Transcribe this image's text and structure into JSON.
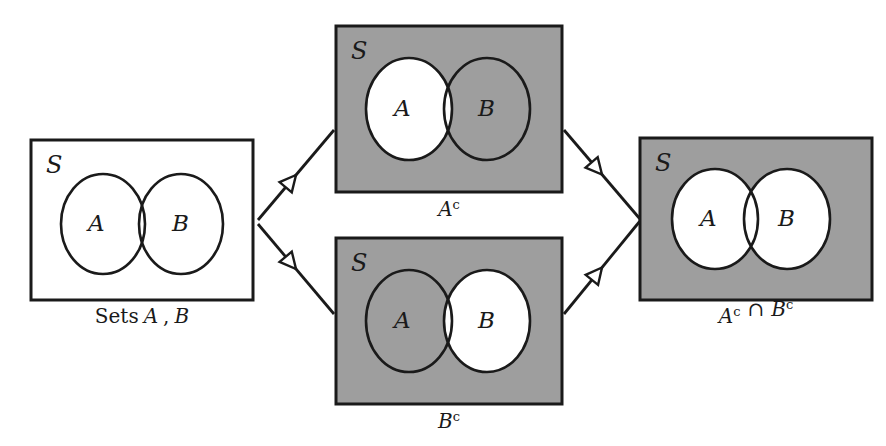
{
  "figure": {
    "type": "venn-diagram-flow",
    "background_color": "#ffffff",
    "shade_color": "#9e9e9e",
    "line_color": "#1a1a1a",
    "universe_symbol": "S",
    "set_a_symbol": "A",
    "set_b_symbol": "B"
  },
  "panels": [
    {
      "id": "sets-ab",
      "caption": "Sets A , B",
      "caption_parts": [
        {
          "text": "Sets",
          "style": "upright"
        },
        {
          "text": "A",
          "style": "italic"
        },
        {
          "text": ",",
          "style": "upright"
        },
        {
          "text": "B",
          "style": "italic"
        }
      ],
      "universe_label": "S",
      "box": {
        "x": 31,
        "y": 140,
        "w": 222,
        "h": 160
      },
      "box_fill": "white",
      "circle_a": {
        "cx": 103,
        "cy": 224,
        "rx": 42,
        "ry": 50,
        "fill": "white",
        "label": "A",
        "label_x": 88,
        "label_y": 231
      },
      "circle_b": {
        "cx": 181,
        "cy": 224,
        "rx": 42,
        "ry": 50,
        "fill": "white",
        "label": "B",
        "label_x": 172,
        "label_y": 231
      },
      "caption_x": 142,
      "caption_y": 323
    },
    {
      "id": "a-complement",
      "caption": "Ac",
      "caption_base": "A",
      "caption_sup": "c",
      "universe_label": "S",
      "box": {
        "x": 336,
        "y": 26,
        "w": 226,
        "h": 166
      },
      "box_fill": "shaded",
      "circle_a": {
        "cx": 409,
        "cy": 109,
        "rx": 43,
        "ry": 51,
        "fill": "white",
        "label": "A",
        "label_x": 394,
        "label_y": 116
      },
      "circle_b": {
        "cx": 487,
        "cy": 109,
        "rx": 43,
        "ry": 51,
        "fill": "shaded",
        "label": "B",
        "label_x": 478,
        "label_y": 116
      },
      "caption_x": 449,
      "caption_y": 216
    },
    {
      "id": "b-complement",
      "caption": "Bc",
      "caption_base": "B",
      "caption_sup": "c",
      "universe_label": "S",
      "box": {
        "x": 336,
        "y": 238,
        "w": 226,
        "h": 166
      },
      "box_fill": "shaded",
      "circle_a": {
        "cx": 409,
        "cy": 321,
        "rx": 43,
        "ry": 51,
        "fill": "shaded",
        "label": "A",
        "label_x": 394,
        "label_y": 328
      },
      "circle_b": {
        "cx": 487,
        "cy": 321,
        "rx": 43,
        "ry": 51,
        "fill": "white",
        "label": "B",
        "label_x": 478,
        "label_y": 328
      },
      "caption_x": 449,
      "caption_y": 428
    },
    {
      "id": "a-complement-intersect-b-complement",
      "caption": "Ac ∩ Bc",
      "caption_parts": [
        {
          "base": "A",
          "sup": "c"
        },
        {
          "op": "∩"
        },
        {
          "base": "B",
          "sup": "c"
        }
      ],
      "universe_label": "S",
      "box": {
        "x": 640,
        "y": 138,
        "w": 232,
        "h": 162
      },
      "box_fill": "shaded",
      "circle_a": {
        "cx": 715,
        "cy": 219,
        "rx": 43,
        "ry": 50,
        "fill": "white",
        "label": "A",
        "label_x": 700,
        "label_y": 226
      },
      "circle_b": {
        "cx": 787,
        "cy": 219,
        "rx": 43,
        "ry": 50,
        "fill": "white",
        "label": "B",
        "label_x": 778,
        "label_y": 226
      },
      "caption_x": 756,
      "caption_y": 323
    }
  ],
  "arrows": [
    {
      "id": "arrow-sets-to-ac",
      "from": "sets-ab",
      "to": "a-complement",
      "x1": 258,
      "y1": 220,
      "x2": 334,
      "y2": 130,
      "head_t": 0.5
    },
    {
      "id": "arrow-sets-to-bc",
      "from": "sets-ab",
      "to": "b-complement",
      "x1": 258,
      "y1": 224,
      "x2": 334,
      "y2": 314,
      "head_t": 0.5
    },
    {
      "id": "arrow-ac-to-result",
      "from": "a-complement",
      "to": "result",
      "x1": 564,
      "y1": 130,
      "x2": 640,
      "y2": 219,
      "head_t": 0.5
    },
    {
      "id": "arrow-bc-to-result",
      "from": "b-complement",
      "to": "result",
      "x1": 564,
      "y1": 314,
      "x2": 640,
      "y2": 221,
      "head_t": 0.5
    }
  ]
}
